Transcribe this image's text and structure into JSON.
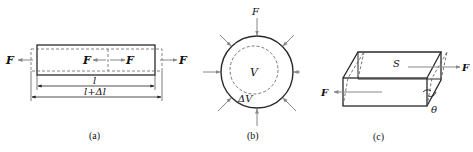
{
  "figure": {
    "panels": [
      {
        "id": "a",
        "caption": "(a)",
        "description": "Bar under axial tension: original length l, elongated length l+Δl",
        "labels": {
          "force_left": "F",
          "force_mid_left": "F",
          "force_mid_right": "F",
          "force_right": "F",
          "length": "l",
          "length_extended": "l+Δl"
        }
      },
      {
        "id": "b",
        "caption": "(b)",
        "description": "Sphere under uniform hydrostatic compression: volume V decreases by ΔV",
        "labels": {
          "force_top": "F",
          "volume": "V",
          "volume_change": "ΔV"
        },
        "arrow_count": 8
      },
      {
        "id": "c",
        "caption": "(c)",
        "description": "Block under shear force on area S with shear angle θ",
        "labels": {
          "area": "S",
          "force_top": "F",
          "force_bottom": "F",
          "angle": "θ"
        }
      }
    ]
  },
  "colors": {
    "line": "#2a2a2a",
    "arrow": "#8a8a8a",
    "dashed": "#555555",
    "text": "#111111"
  }
}
